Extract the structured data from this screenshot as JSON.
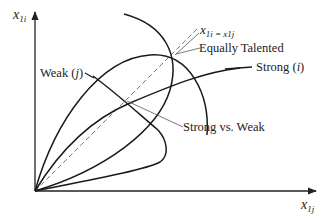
{
  "diagram": {
    "axes": {
      "y_label_base": "x",
      "y_label_sub": "1i",
      "x_label_base": "x",
      "x_label_sub": "1j"
    },
    "labels": {
      "diagonal": "x",
      "diagonal_eq": "1i = x",
      "diagonal_sub2": "1j",
      "equally_talented": "Equally Talented",
      "strong": "Strong (",
      "strong_var": "i",
      "strong_close": ")",
      "weak": "Weak (",
      "weak_var": "j",
      "weak_close": ")",
      "strong_vs_weak": "Strong vs. Weak"
    },
    "colors": {
      "curve": "#1a1a1a",
      "leader": "#555555",
      "dashed": "#777777"
    }
  }
}
